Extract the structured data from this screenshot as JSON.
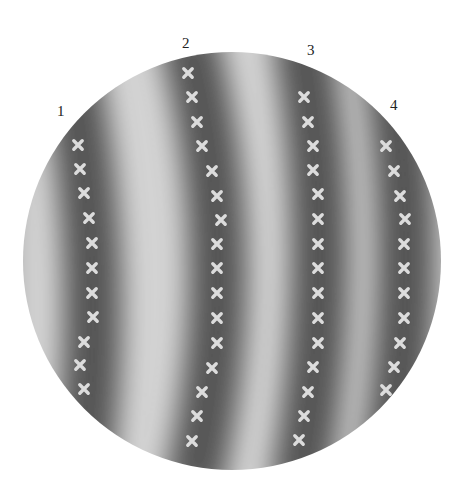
{
  "figure": {
    "type": "interference fringe pattern in circular aperture",
    "circle": {
      "cx": 232,
      "cy": 261,
      "r": 209
    },
    "colors": {
      "dark": "#555555",
      "light": "#d4d4d4",
      "marker": "#dcdcdc",
      "label": "#222222"
    },
    "labels": [
      {
        "text": "1",
        "x": 57,
        "y": 104
      },
      {
        "text": "2",
        "x": 182,
        "y": 36
      },
      {
        "text": "3",
        "x": 307,
        "y": 43
      },
      {
        "text": "4",
        "x": 390,
        "y": 98
      }
    ],
    "dark_fringes": [
      {
        "top": 62,
        "mid": 92,
        "bottom": 84,
        "xTop": 62,
        "xMid": 92,
        "xBot": 80
      },
      {
        "xTop": 186,
        "xMid": 218,
        "xBot": 192
      },
      {
        "xTop": 300,
        "xMid": 320,
        "xBot": 298
      },
      {
        "xTop": 385,
        "xMid": 406,
        "xBot": 384
      }
    ],
    "marker_columns": [
      {
        "id": 1,
        "points": [
          [
            78,
            145
          ],
          [
            80,
            169
          ],
          [
            84,
            193
          ],
          [
            89,
            218
          ],
          [
            92,
            243
          ],
          [
            92,
            268
          ],
          [
            92,
            293
          ],
          [
            93,
            317
          ],
          [
            84,
            342
          ],
          [
            80,
            365
          ],
          [
            84,
            389
          ]
        ]
      },
      {
        "id": 2,
        "points": [
          [
            188,
            73
          ],
          [
            192,
            97
          ],
          [
            197,
            122
          ],
          [
            202,
            146
          ],
          [
            212,
            171
          ],
          [
            217,
            196
          ],
          [
            221,
            220
          ],
          [
            217,
            244
          ],
          [
            217,
            268
          ],
          [
            217,
            293
          ],
          [
            217,
            318
          ],
          [
            217,
            343
          ],
          [
            212,
            368
          ],
          [
            202,
            392
          ],
          [
            197,
            416
          ],
          [
            192,
            441
          ]
        ]
      },
      {
        "id": 3,
        "points": [
          [
            304,
            97
          ],
          [
            308,
            122
          ],
          [
            313,
            146
          ],
          [
            313,
            170
          ],
          [
            318,
            194
          ],
          [
            318,
            219
          ],
          [
            318,
            244
          ],
          [
            318,
            268
          ],
          [
            318,
            293
          ],
          [
            318,
            318
          ],
          [
            318,
            343
          ],
          [
            313,
            367
          ],
          [
            308,
            392
          ],
          [
            304,
            416
          ],
          [
            299,
            440
          ]
        ]
      },
      {
        "id": 4,
        "points": [
          [
            386,
            146
          ],
          [
            394,
            171
          ],
          [
            400,
            196
          ],
          [
            405,
            219
          ],
          [
            404,
            244
          ],
          [
            404,
            268
          ],
          [
            404,
            293
          ],
          [
            404,
            318
          ],
          [
            400,
            343
          ],
          [
            394,
            367
          ],
          [
            386,
            390
          ]
        ]
      }
    ]
  }
}
